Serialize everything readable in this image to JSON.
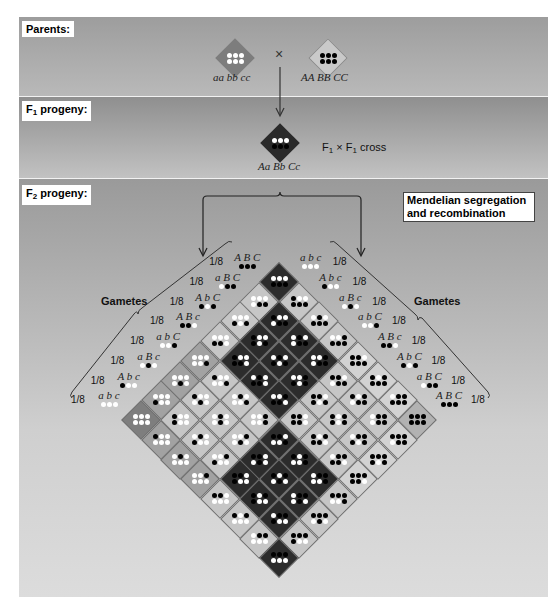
{
  "sections": {
    "parents": {
      "label": "Parents:"
    },
    "f1": {
      "label_main": "F",
      "label_sub": "1",
      "label_rest": " progeny:"
    },
    "f2": {
      "label_main": "F",
      "label_sub": "2",
      "label_rest": " progeny:"
    }
  },
  "parents": {
    "left": {
      "genotype": "aa bb cc",
      "dots": [
        "w",
        "w",
        "w",
        "w",
        "w",
        "w"
      ],
      "color": "#7d7d7d"
    },
    "cross_symbol": "×",
    "right": {
      "genotype": "AA BB CC",
      "dots": [
        "b",
        "b",
        "b",
        "b",
        "b",
        "b"
      ],
      "color": "#c9c9c9"
    }
  },
  "f1": {
    "genotype": "Aa Bb Cc",
    "dots": [
      "w",
      "w",
      "w",
      "b",
      "b",
      "b"
    ],
    "color": "#2a2a2a",
    "cross_text": {
      "a": "F",
      "a_sub": "1",
      "x": " × ",
      "b": "F",
      "b_sub": "1",
      "rest": " cross"
    }
  },
  "annotation": {
    "line1": "Mendelian segregation",
    "line2": "and recombination"
  },
  "gametes": {
    "title_left": "Gametes",
    "title_right": "Gametes",
    "fraction": "1/8",
    "left": [
      "ABC",
      "aBC",
      "AbC",
      "ABc",
      "abC",
      "aBc",
      "Abc",
      "abc"
    ],
    "right": [
      "abc",
      "Abc",
      "aBc",
      "abC",
      "ABc",
      "AbC",
      "aBC",
      "ABC"
    ]
  },
  "shading": {
    "0": "#7e7e7e",
    "1": "#a2a2a2",
    "2": "#c6c6c6",
    "3": "#2c2c2c",
    "4": "#c6c6c6",
    "5": "#d2d2d2",
    "6": "#b2b2b2"
  }
}
